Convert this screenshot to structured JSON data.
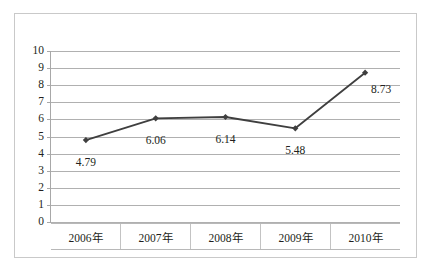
{
  "chart_data": {
    "type": "line",
    "title": "",
    "subtitle": "",
    "xlabel": "",
    "ylabel": "",
    "categories": [
      "2006年",
      "2007年",
      "2008年",
      "2009年",
      "2010年"
    ],
    "series": [
      {
        "name": "",
        "values": [
          4.79,
          6.06,
          6.14,
          5.48,
          8.73
        ],
        "labels": [
          "4.79",
          "6.06",
          "6.14",
          "5.48",
          "8.73"
        ],
        "color": "#3f3f3f",
        "marker": "diamond"
      }
    ],
    "ylim": [
      0,
      10
    ],
    "ytick_step": 1,
    "ytick_labels": [
      "10",
      "9",
      "8",
      "7",
      "6",
      "5",
      "4",
      "3",
      "2",
      "1",
      "0"
    ],
    "grid": true,
    "grid_axis": "y",
    "legend": false,
    "legend_position": "none",
    "data_labels_shown": true
  },
  "style": {
    "frame_border_color": "#c9c9c9",
    "gridline_color": "#b0b0b0",
    "axis_color": "#a8a8a8",
    "text_color": "#231f20",
    "series_color": "#3f3f3f",
    "background": "#ffffff"
  },
  "label_offsets": [
    {
      "dx": 0,
      "dy": 17
    },
    {
      "dx": 0,
      "dy": 17
    },
    {
      "dx": 0,
      "dy": 17
    },
    {
      "dx": 0,
      "dy": 17
    },
    {
      "dx": 16,
      "dy": 11
    }
  ]
}
